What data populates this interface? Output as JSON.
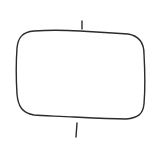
{
  "diagram": {
    "caption": "",
    "shape": {
      "type": "rounded-rectangle",
      "stroke": "#2b2b2b",
      "fill": "#ffffff"
    },
    "connectors": [
      {
        "position": "top",
        "stroke": "#2b2b2b"
      },
      {
        "position": "bottom",
        "stroke": "#2b2b2b"
      }
    ]
  }
}
